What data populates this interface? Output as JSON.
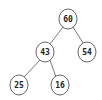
{
  "diagram": {
    "type": "binary-tree",
    "nodes": [
      {
        "id": "n60",
        "label": "60",
        "cx": 68,
        "cy": 19
      },
      {
        "id": "n43",
        "label": "43",
        "cx": 45,
        "cy": 52
      },
      {
        "id": "n54",
        "label": "54",
        "cx": 87,
        "cy": 52
      },
      {
        "id": "n25",
        "label": "25",
        "cx": 19,
        "cy": 85
      },
      {
        "id": "n16",
        "label": "16",
        "cx": 60,
        "cy": 85
      }
    ],
    "edges": [
      {
        "from": "60",
        "to": "43"
      },
      {
        "from": "60",
        "to": "54"
      },
      {
        "from": "43",
        "to": "25"
      },
      {
        "from": "43",
        "to": "16"
      }
    ],
    "colors": {
      "background": "#ffffff",
      "node_stroke": "#555555",
      "edge_stroke": "#6a6a6a",
      "text": "#222222"
    }
  }
}
